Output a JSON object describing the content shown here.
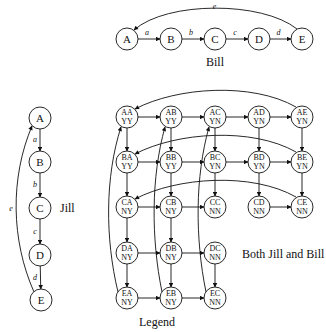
{
  "bill": {
    "title": "Bill",
    "nodes": [
      {
        "id": "A",
        "x": 127,
        "y": 39
      },
      {
        "id": "B",
        "x": 171,
        "y": 39
      },
      {
        "id": "C",
        "x": 215,
        "y": 39
      },
      {
        "id": "D",
        "x": 259,
        "y": 39
      },
      {
        "id": "E",
        "x": 302,
        "y": 39
      }
    ],
    "edges": [
      {
        "from": "A",
        "to": "B",
        "label": "a"
      },
      {
        "from": "B",
        "to": "C",
        "label": "b"
      },
      {
        "from": "C",
        "to": "D",
        "label": "c"
      },
      {
        "from": "D",
        "to": "E",
        "label": "d"
      },
      {
        "from": "E",
        "to": "A",
        "label": "e"
      }
    ]
  },
  "jill": {
    "title": "Jill",
    "nodes": [
      {
        "id": "A",
        "x": 40,
        "y": 118
      },
      {
        "id": "B",
        "x": 40,
        "y": 162
      },
      {
        "id": "C",
        "x": 40,
        "y": 208
      },
      {
        "id": "D",
        "x": 40,
        "y": 255
      },
      {
        "id": "E",
        "x": 41,
        "y": 300
      }
    ],
    "edges": [
      {
        "from": "A",
        "to": "B",
        "label": "a"
      },
      {
        "from": "B",
        "to": "C",
        "label": "b"
      },
      {
        "from": "C",
        "to": "D",
        "label": "c"
      },
      {
        "from": "D",
        "to": "E",
        "label": "d"
      },
      {
        "from": "E",
        "to": "A",
        "label": "e"
      }
    ]
  },
  "both": {
    "title": "Both Jill and Bill",
    "legend_label": "Legend",
    "nodes": [
      {
        "id": "AA",
        "sub": "YY",
        "x": 127,
        "y": 117
      },
      {
        "id": "AB",
        "sub": "YY",
        "x": 171,
        "y": 117
      },
      {
        "id": "AC",
        "sub": "YN",
        "x": 215,
        "y": 117
      },
      {
        "id": "AD",
        "sub": "YN",
        "x": 259,
        "y": 117
      },
      {
        "id": "AE",
        "sub": "YN",
        "x": 302,
        "y": 117
      },
      {
        "id": "BA",
        "sub": "YY",
        "x": 127,
        "y": 162
      },
      {
        "id": "BB",
        "sub": "YY",
        "x": 171,
        "y": 162
      },
      {
        "id": "BC",
        "sub": "YN",
        "x": 215,
        "y": 162
      },
      {
        "id": "BD",
        "sub": "YN",
        "x": 259,
        "y": 162
      },
      {
        "id": "BE",
        "sub": "YN",
        "x": 302,
        "y": 162
      },
      {
        "id": "CA",
        "sub": "NY",
        "x": 127,
        "y": 207
      },
      {
        "id": "CB",
        "sub": "NY",
        "x": 171,
        "y": 207
      },
      {
        "id": "CC",
        "sub": "NN",
        "x": 215,
        "y": 207
      },
      {
        "id": "CD",
        "sub": "NN",
        "x": 259,
        "y": 207
      },
      {
        "id": "CE",
        "sub": "NN",
        "x": 302,
        "y": 207
      },
      {
        "id": "DA",
        "sub": "NY",
        "x": 127,
        "y": 253
      },
      {
        "id": "DB",
        "sub": "NY",
        "x": 171,
        "y": 253
      },
      {
        "id": "DC",
        "sub": "NN",
        "x": 215,
        "y": 253
      },
      {
        "id": "EA",
        "sub": "NY",
        "x": 127,
        "y": 298
      },
      {
        "id": "EB",
        "sub": "NY",
        "x": 171,
        "y": 298
      },
      {
        "id": "EC",
        "sub": "NN",
        "x": 215,
        "y": 298
      }
    ],
    "straight_edges": [
      [
        "AA",
        "AB"
      ],
      [
        "AB",
        "AC"
      ],
      [
        "AC",
        "AD"
      ],
      [
        "AD",
        "AE"
      ],
      [
        "BA",
        "BB"
      ],
      [
        "BB",
        "BC"
      ],
      [
        "BC",
        "BD"
      ],
      [
        "BD",
        "BE"
      ],
      [
        "CA",
        "CB"
      ],
      [
        "CB",
        "CC"
      ],
      [
        "CD",
        "CE"
      ],
      [
        "DA",
        "DB"
      ],
      [
        "DB",
        "DC"
      ],
      [
        "EA",
        "EB"
      ],
      [
        "EB",
        "EC"
      ],
      [
        "AA",
        "BA"
      ],
      [
        "BA",
        "CA"
      ],
      [
        "CA",
        "DA"
      ],
      [
        "DA",
        "EA"
      ],
      [
        "AB",
        "BB"
      ],
      [
        "BB",
        "CB"
      ],
      [
        "CB",
        "DB"
      ],
      [
        "DB",
        "EB"
      ],
      [
        "AC",
        "BC"
      ],
      [
        "BC",
        "CC"
      ],
      [
        "AD",
        "BD"
      ],
      [
        "BD",
        "CD"
      ],
      [
        "AE",
        "BE"
      ],
      [
        "BE",
        "CE"
      ],
      [
        "DC",
        "EC"
      ]
    ],
    "curved_edges": [
      [
        "AE",
        "AA"
      ],
      [
        "BE",
        "BA"
      ],
      [
        "CE",
        "CA"
      ],
      [
        "EA",
        "AA"
      ],
      [
        "EB",
        "AB"
      ],
      [
        "EC",
        "AC"
      ]
    ]
  }
}
